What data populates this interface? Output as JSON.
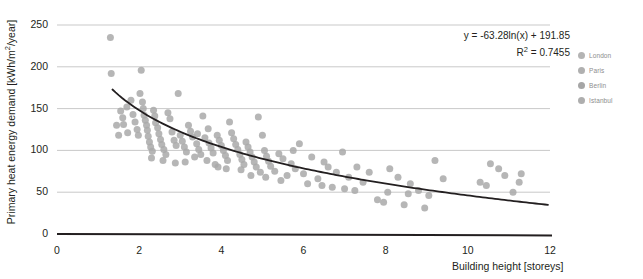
{
  "chart_data": {
    "type": "scatter",
    "title": "",
    "xlabel": "Building height [storeys]",
    "ylabel": "Primary heat energy demand [kWh/m2/year]",
    "ylabel_prefix": "Primary heat energy demand [kWh/m",
    "ylabel_exponent": "2",
    "ylabel_suffix": "/year]",
    "xlim": [
      0,
      12
    ],
    "ylim": [
      0,
      250
    ],
    "xticks": [
      "0",
      "2",
      "4",
      "6",
      "8",
      "10",
      "12"
    ],
    "xtick_values": [
      0,
      2,
      4,
      6,
      8,
      10,
      12
    ],
    "yticks": [
      "0",
      "50",
      "100",
      "150",
      "200",
      "250"
    ],
    "ytick_values": [
      0,
      50,
      100,
      150,
      200,
      250
    ],
    "grid": "horizontal",
    "grid_color": "#c9c9c9",
    "axis_color": "#231f20",
    "marker_color": "#a9a9a9",
    "marker_size": 7,
    "marker_opacity": 0.85,
    "trendline": {
      "type": "logarithmic",
      "equation": "y =  -63.28ln(x) + 191.85",
      "r_squared_label": "R",
      "r_squared_exponent": "2",
      "r_squared_value": "= 0.7455",
      "coefficient": -63.28,
      "intercept": 191.85,
      "r_squared": 0.7455,
      "color": "#231f20",
      "x_start": 1.35,
      "x_end": 11.95
    },
    "legend": {
      "position": "right",
      "entries": [
        {
          "label": "London",
          "color": "#b4b4b4"
        },
        {
          "label": "Paris",
          "color": "#b0b0b0"
        },
        {
          "label": "Berlin",
          "color": "#a6a6a6"
        },
        {
          "label": "Istanbul",
          "color": "#aeaeae"
        }
      ]
    },
    "points": [
      [
        1.3,
        235
      ],
      [
        1.32,
        192
      ],
      [
        1.55,
        147
      ],
      [
        1.6,
        139
      ],
      [
        1.62,
        131
      ],
      [
        1.7,
        152
      ],
      [
        1.72,
        121
      ],
      [
        1.8,
        160
      ],
      [
        1.85,
        143
      ],
      [
        1.9,
        134
      ],
      [
        1.95,
        125
      ],
      [
        1.98,
        118
      ],
      [
        2.05,
        196
      ],
      [
        2.08,
        158
      ],
      [
        2.1,
        150
      ],
      [
        2.12,
        142
      ],
      [
        2.15,
        136
      ],
      [
        2.18,
        130
      ],
      [
        2.2,
        124
      ],
      [
        2.22,
        117
      ],
      [
        2.25,
        110
      ],
      [
        2.28,
        104
      ],
      [
        2.32,
        99
      ],
      [
        2.35,
        148
      ],
      [
        2.38,
        141
      ],
      [
        2.4,
        133
      ],
      [
        2.45,
        127
      ],
      [
        2.48,
        120
      ],
      [
        2.52,
        113
      ],
      [
        2.55,
        107
      ],
      [
        2.6,
        101
      ],
      [
        2.65,
        95
      ],
      [
        2.7,
        145
      ],
      [
        2.75,
        138
      ],
      [
        2.8,
        122
      ],
      [
        2.85,
        112
      ],
      [
        2.9,
        106
      ],
      [
        2.95,
        168
      ],
      [
        3.0,
        118
      ],
      [
        3.05,
        111
      ],
      [
        3.1,
        104
      ],
      [
        3.15,
        98
      ],
      [
        3.2,
        130
      ],
      [
        3.25,
        123
      ],
      [
        3.3,
        116
      ],
      [
        3.35,
        92
      ],
      [
        3.4,
        108
      ],
      [
        3.45,
        101
      ],
      [
        3.5,
        95
      ],
      [
        3.55,
        141
      ],
      [
        3.6,
        115
      ],
      [
        3.65,
        88
      ],
      [
        3.7,
        109
      ],
      [
        3.75,
        103
      ],
      [
        3.8,
        97
      ],
      [
        3.85,
        83
      ],
      [
        3.9,
        118
      ],
      [
        3.95,
        112
      ],
      [
        4.0,
        106
      ],
      [
        4.05,
        100
      ],
      [
        4.1,
        94
      ],
      [
        4.15,
        88
      ],
      [
        4.2,
        134
      ],
      [
        4.25,
        121
      ],
      [
        4.3,
        114
      ],
      [
        4.35,
        107
      ],
      [
        4.4,
        101
      ],
      [
        4.45,
        95
      ],
      [
        4.5,
        89
      ],
      [
        4.55,
        83
      ],
      [
        4.6,
        110
      ],
      [
        4.65,
        104
      ],
      [
        4.7,
        98
      ],
      [
        4.75,
        92
      ],
      [
        4.8,
        86
      ],
      [
        4.85,
        80
      ],
      [
        4.9,
        140
      ],
      [
        4.95,
        74
      ],
      [
        5.0,
        118
      ],
      [
        5.05,
        100
      ],
      [
        5.1,
        93
      ],
      [
        5.15,
        87
      ],
      [
        5.2,
        81
      ],
      [
        5.3,
        75
      ],
      [
        5.4,
        96
      ],
      [
        5.5,
        90
      ],
      [
        5.6,
        70
      ],
      [
        5.7,
        84
      ],
      [
        5.8,
        78
      ],
      [
        5.9,
        108
      ],
      [
        6.0,
        72
      ],
      [
        6.2,
        92
      ],
      [
        6.35,
        66
      ],
      [
        6.5,
        86
      ],
      [
        6.6,
        80
      ],
      [
        6.8,
        74
      ],
      [
        6.95,
        98
      ],
      [
        7.1,
        68
      ],
      [
        7.3,
        80
      ],
      [
        7.45,
        62
      ],
      [
        7.6,
        74
      ],
      [
        7.8,
        41
      ],
      [
        7.95,
        38
      ],
      [
        8.1,
        78
      ],
      [
        8.3,
        68
      ],
      [
        8.45,
        35
      ],
      [
        8.6,
        60
      ],
      [
        8.8,
        52
      ],
      [
        8.95,
        31
      ],
      [
        9.2,
        88
      ],
      [
        9.4,
        66
      ],
      [
        10.3,
        62
      ],
      [
        10.45,
        58
      ],
      [
        10.55,
        84
      ],
      [
        10.75,
        78
      ],
      [
        10.9,
        70
      ],
      [
        11.1,
        50
      ],
      [
        11.25,
        62
      ],
      [
        11.3,
        72
      ],
      [
        1.45,
        130
      ],
      [
        1.5,
        118
      ],
      [
        2.02,
        168
      ],
      [
        2.3,
        91
      ],
      [
        2.58,
        88
      ],
      [
        2.88,
        85
      ],
      [
        3.12,
        86
      ],
      [
        3.42,
        120
      ],
      [
        3.68,
        126
      ],
      [
        3.92,
        80
      ],
      [
        4.12,
        78
      ],
      [
        4.48,
        77
      ],
      [
        4.72,
        70
      ],
      [
        5.08,
        68
      ],
      [
        5.45,
        64
      ],
      [
        5.75,
        100
      ],
      [
        6.1,
        60
      ],
      [
        6.45,
        58
      ],
      [
        6.7,
        56
      ],
      [
        7.0,
        54
      ],
      [
        7.25,
        52
      ],
      [
        8.05,
        50
      ],
      [
        8.55,
        48
      ],
      [
        9.05,
        46
      ]
    ]
  }
}
